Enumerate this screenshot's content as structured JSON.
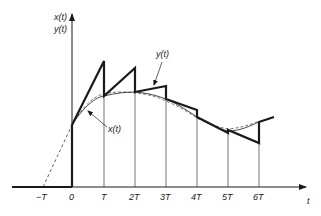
{
  "diagram": {
    "axes": {
      "y_label_line1": "x(t)",
      "y_label_line2": "y(t)",
      "x_label": "t"
    },
    "ticks": [
      {
        "label": "−T",
        "x": 43
      },
      {
        "label": "0",
        "x": 72
      },
      {
        "label": "T",
        "x": 104
      },
      {
        "label": "2T",
        "x": 135
      },
      {
        "label": "3T",
        "x": 166
      },
      {
        "label": "4T",
        "x": 197
      },
      {
        "label": "5T",
        "x": 228
      },
      {
        "label": "6T",
        "x": 259
      }
    ],
    "annotations": {
      "y_curve_label": "y(t)",
      "x_curve_label": "x(t)"
    },
    "colors": {
      "ink": "#1a1a1a",
      "background": "#ffffff"
    }
  }
}
